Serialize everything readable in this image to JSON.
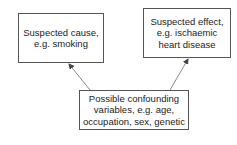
{
  "diagram": {
    "nodes": {
      "cause": {
        "label": "Suspected cause,\ne.g. smoking"
      },
      "effect": {
        "label": "Suspected effect,\ne.g. ischaemic\nheart disease"
      },
      "confounders": {
        "label": "Possible confounding\nvariables, e.g. age,\noccupation, sex, genetic"
      }
    },
    "edges": [
      {
        "from": "confounders",
        "to": "cause"
      },
      {
        "from": "confounders",
        "to": "effect"
      }
    ],
    "colors": {
      "border": "#555555",
      "arrow": "#888888",
      "text": "#222222"
    }
  }
}
